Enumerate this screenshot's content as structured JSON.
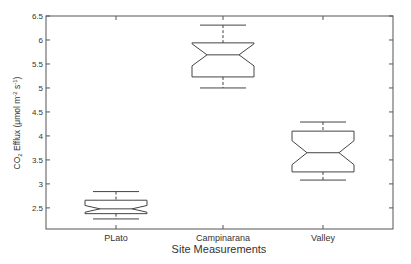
{
  "chart_data": {
    "type": "boxplot",
    "notched": true,
    "title": "",
    "xlabel": "Site Measurements",
    "ylabel": "CO2 Efflux (μmol m-2 s-1)",
    "ylabel_parts": {
      "main": "CO",
      "sub": "2",
      "rest": " Efflux (μmol m",
      "sup1": "-2",
      "mid": " s",
      "sup2": "-1",
      "end": ")"
    },
    "ylim": [
      2.06,
      6.5
    ],
    "yticks": [
      2.5,
      3,
      3.5,
      4,
      4.5,
      5,
      5.5,
      6,
      6.5
    ],
    "ytick_labels": [
      "2.5",
      "3",
      "3.5",
      "4",
      "4.5",
      "5",
      "5.5",
      "6",
      "6.5"
    ],
    "categories": [
      "PLato",
      "Campinarana",
      "Valley"
    ],
    "series": [
      {
        "name": "PLato",
        "whisker_low": 2.27,
        "q1": 2.38,
        "median": 2.48,
        "q3": 2.66,
        "whisker_high": 2.84,
        "notch_low": 2.41,
        "notch_high": 2.55
      },
      {
        "name": "Campinarana",
        "whisker_low": 5.0,
        "q1": 5.23,
        "median": 5.69,
        "q3": 5.94,
        "whisker_high": 6.31,
        "notch_low": 5.46,
        "notch_high": 5.92
      },
      {
        "name": "Valley",
        "whisker_low": 3.08,
        "q1": 3.25,
        "median": 3.65,
        "q3": 4.1,
        "whisker_high": 4.29,
        "notch_low": 3.4,
        "notch_high": 3.9
      }
    ],
    "grid": false,
    "legend": null,
    "colors": {
      "line": "#444444",
      "axis": "#555555",
      "text": "#333333"
    }
  }
}
